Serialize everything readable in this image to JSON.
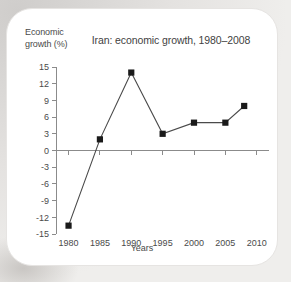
{
  "card": {
    "background_color": "#ffffff",
    "page_background_color": "#e2e0de"
  },
  "chart_data": {
    "type": "line",
    "title": "Iran: economic growth, 1980–2008",
    "xlabel": "Years",
    "ylabel": "Economic growth (%)",
    "x": [
      1980,
      1985,
      1990,
      1995,
      2000,
      2005,
      2008
    ],
    "values": [
      -13.5,
      2,
      14,
      3,
      5,
      5,
      8
    ],
    "xlim": [
      1978,
      2011
    ],
    "ylim": [
      -15,
      15
    ],
    "xticks": [
      1980,
      1985,
      1990,
      1995,
      2000,
      2005,
      2010
    ],
    "xtick_labels": [
      "1980",
      "1985",
      "1990",
      "1995",
      "2000",
      "2005",
      "2010"
    ],
    "yticks": [
      15,
      12,
      9,
      6,
      3,
      0,
      -3,
      -6,
      -9,
      -12,
      -15
    ],
    "ytick_labels": [
      "15",
      "12",
      "9",
      "6",
      "3",
      "0",
      "-3",
      "-6",
      "-9",
      "-12",
      "-15"
    ],
    "grid": false,
    "legend": false,
    "marker": "square",
    "marker_color": "#1a1a1a",
    "line_color": "#4a4a4a",
    "axis_color": "#8b8b8b"
  }
}
